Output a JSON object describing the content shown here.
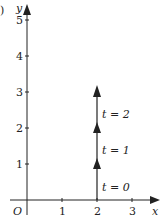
{
  "figure": {
    "panel_label": ")",
    "axes": {
      "x_label": "x",
      "y_label": "y",
      "origin_label": "O",
      "x_ticks": [
        "1",
        "2",
        "3"
      ],
      "y_ticks": [
        "1",
        "2",
        "3",
        "4",
        "5"
      ]
    },
    "path": {
      "description": "Vertical motion along x = 2 upward",
      "x": 2,
      "points": [
        {
          "y": 0,
          "label": "t = 0"
        },
        {
          "y": 1,
          "label": "t = 1"
        },
        {
          "y": 2,
          "label": "t = 2"
        }
      ],
      "arrowheads_at_y": [
        1,
        2,
        3
      ]
    },
    "colors": {
      "ink": "#222222",
      "background": "#ffffff"
    }
  }
}
